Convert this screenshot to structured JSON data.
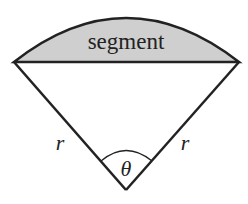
{
  "diagram": {
    "segment_label": "segment",
    "radius_left_label": "r",
    "radius_right_label": "r",
    "angle_label": "θ",
    "colors": {
      "segment_fill": "#cfcfcf",
      "stroke": "#222222",
      "background": "#ffffff"
    }
  }
}
